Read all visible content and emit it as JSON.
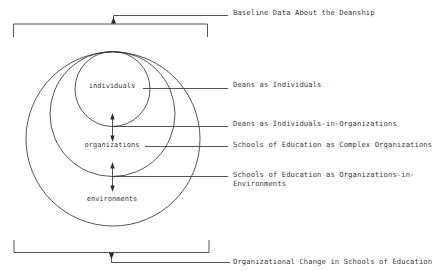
{
  "diagram": {
    "inner_labels": {
      "individuals": "individuals",
      "organizations": "organizations",
      "environments": "environments"
    },
    "side_labels": {
      "baseline": "Baseline Data About the Deanship",
      "deans_individuals": "Deans as Individuals",
      "deans_in_orgs": "Deans as Individuals-in-Organizations",
      "complex_orgs": "Schools of Education as Complex Organizations",
      "orgs_in_env_line1": "Schools of Education as Organizations-in-",
      "orgs_in_env_line2": "Environments",
      "org_change": "Organizational Change in Schools of Education"
    },
    "colors": {
      "line": "#2a2a2a",
      "text": "#3a3a3a",
      "background": "#ffffff"
    }
  }
}
